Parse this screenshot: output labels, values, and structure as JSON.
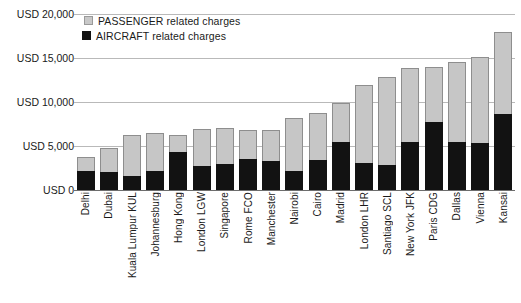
{
  "chart_data": {
    "type": "bar",
    "subtype": "stacked-vertical",
    "title": "",
    "xlabel": "",
    "ylabel": "",
    "ylim": [
      0,
      20000
    ],
    "ytick_values": [
      0,
      5000,
      10000,
      15000,
      20000
    ],
    "ytick_labels": [
      "USD 0",
      "USD 5,000",
      "USD 10,000",
      "USD 15,000",
      "USD 20,000"
    ],
    "grid": true,
    "legend_position": "top-left",
    "categories": [
      "Delhi",
      "Dubai",
      "Kuala Lumpur KUL",
      "Johannesburg",
      "Hong Kong",
      "London LGW",
      "Singapore",
      "Rome FCO",
      "Manchester",
      "Nairobi",
      "Cairo",
      "Madrid",
      "London LHR",
      "Santiago SCL",
      "New York JFK",
      "Paris CDG",
      "Dallas",
      "Vienna",
      "Kansai"
    ],
    "series": [
      {
        "name": "AIRCRAFT related charges",
        "color": "#121212",
        "values": [
          2200,
          2000,
          1600,
          2200,
          4300,
          2700,
          2900,
          3500,
          3300,
          2200,
          3400,
          5500,
          3100,
          2800,
          5400,
          7700,
          5500,
          5300,
          8600
        ]
      },
      {
        "name": "PASSENGER related charges",
        "color": "#c6c6c6",
        "values": [
          1600,
          2800,
          4700,
          4300,
          2000,
          4200,
          4100,
          3300,
          3500,
          6000,
          5400,
          4400,
          8800,
          10100,
          8500,
          6300,
          9100,
          9800,
          9400
        ]
      }
    ],
    "totals": [
      3800,
      4800,
      6300,
      6500,
      6300,
      6900,
      7000,
      6800,
      6800,
      8200,
      8800,
      9900,
      11900,
      12900,
      13900,
      14000,
      14600,
      15100,
      18000
    ]
  },
  "legend": {
    "items": [
      {
        "label": "PASSENGER related charges",
        "swatch": "passenger-swatch"
      },
      {
        "label": "AIRCRAFT related charges",
        "swatch": "aircraft-swatch"
      }
    ]
  }
}
